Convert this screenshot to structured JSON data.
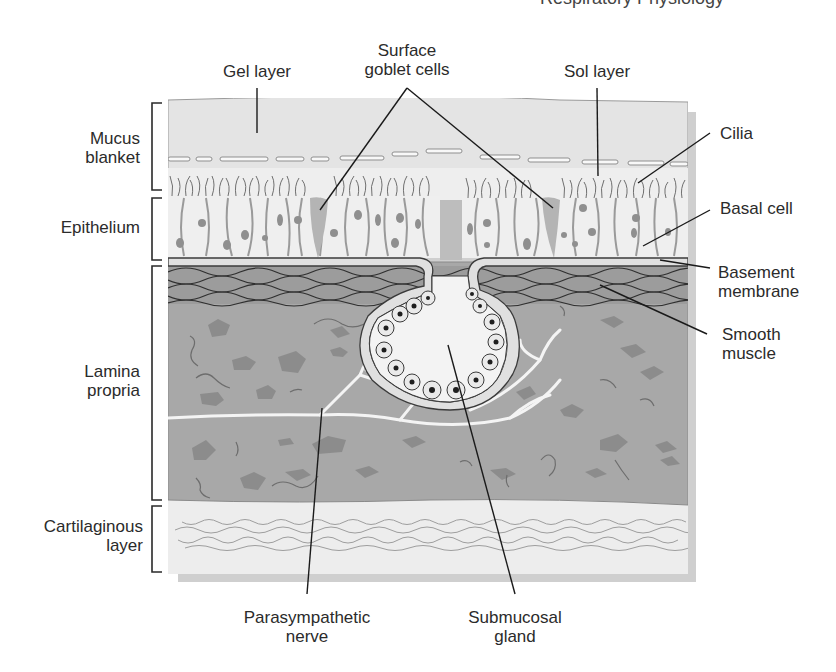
{
  "header": {
    "fragment": "Respiratory Physiology"
  },
  "diagram": {
    "colors": {
      "mucus": "#e6e6e6",
      "epithelium": "#efefef",
      "cell_outline": "#9a9a9a",
      "nucleus": "#8f8f8f",
      "goblet": "#b4b4b4",
      "basement": "#dedede",
      "muscle": "#9c9c9c",
      "lamina": "#a9a9a9",
      "lamina_blob": "#8a8a8a",
      "nerve": "#f4f4f4",
      "cartilage": "#ececec",
      "leader": "#1a1a1a",
      "shadow": "#c9c9c9"
    }
  },
  "left_labels": [
    {
      "id": "mucus-blanket",
      "lines": [
        "Mucus",
        "blanket"
      ]
    },
    {
      "id": "epithelium",
      "lines": [
        "Epithelium"
      ]
    },
    {
      "id": "lamina-propria",
      "lines": [
        "Lamina",
        "propria"
      ]
    },
    {
      "id": "cartilaginous-layer",
      "lines": [
        "Cartilaginous",
        "layer"
      ]
    }
  ],
  "top_labels": [
    {
      "id": "gel-layer",
      "lines": [
        "Gel layer"
      ]
    },
    {
      "id": "surface-goblet-cells",
      "lines": [
        "Surface",
        "goblet cells"
      ]
    },
    {
      "id": "sol-layer",
      "lines": [
        "Sol layer"
      ]
    }
  ],
  "right_labels": [
    {
      "id": "cilia",
      "lines": [
        "Cilia"
      ]
    },
    {
      "id": "basal-cell",
      "lines": [
        "Basal cell"
      ]
    },
    {
      "id": "basement-membrane",
      "lines": [
        "Basement",
        "membrane"
      ]
    },
    {
      "id": "smooth-muscle",
      "lines": [
        "Smooth",
        "muscle"
      ]
    }
  ],
  "bottom_labels": [
    {
      "id": "parasympathetic-nerve",
      "lines": [
        "Parasympathetic",
        "nerve"
      ]
    },
    {
      "id": "submucosal-gland",
      "lines": [
        "Submucosal",
        "gland"
      ]
    }
  ]
}
